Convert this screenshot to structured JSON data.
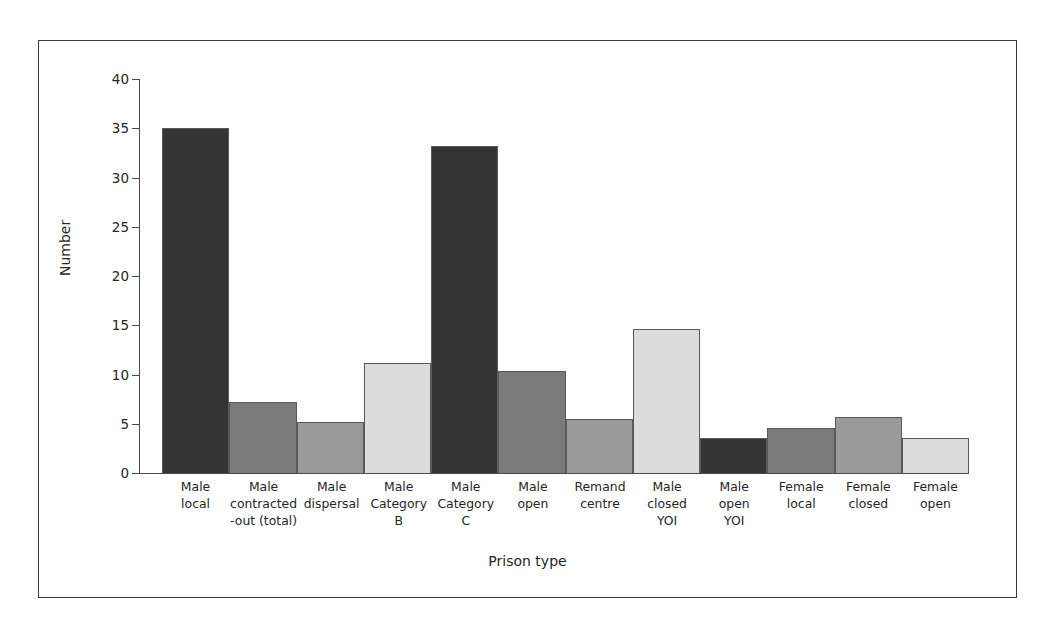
{
  "chart_data": {
    "type": "bar",
    "title": "",
    "xlabel": "Prison type",
    "ylabel": "Number",
    "ylim": [
      0,
      40
    ],
    "yticks": [
      0,
      5,
      10,
      15,
      20,
      25,
      30,
      35,
      40
    ],
    "grid": false,
    "legend": "none",
    "categories": [
      "Male local",
      "Male contracted -out (total)",
      "Male dispersal",
      "Male Category B",
      "Male Category C",
      "Male open",
      "Remand centre",
      "Male closed YOI",
      "Male open YOI",
      "Female local",
      "Female closed",
      "Female open"
    ],
    "category_lines": [
      [
        "Male",
        "local"
      ],
      [
        "Male",
        "contracted",
        "-out (total)"
      ],
      [
        "Male",
        "dispersal"
      ],
      [
        "Male",
        "Category",
        "B"
      ],
      [
        "Male",
        "Category",
        "C"
      ],
      [
        "Male",
        "open"
      ],
      [
        "Remand",
        "centre"
      ],
      [
        "Male",
        "closed",
        "YOI"
      ],
      [
        "Male",
        "open",
        "YOI"
      ],
      [
        "Female",
        "local"
      ],
      [
        "Female",
        "closed"
      ],
      [
        "Female",
        "open"
      ]
    ],
    "values": [
      35,
      7.2,
      5.2,
      11.2,
      33.2,
      10.4,
      5.5,
      14.6,
      3.6,
      4.6,
      5.7,
      3.6
    ],
    "bar_colors": [
      "#353535",
      "#7a7a7a",
      "#9a9a9a",
      "#dcdcdc",
      "#353535",
      "#7a7a7a",
      "#9a9a9a",
      "#dcdcdc",
      "#353535",
      "#7a7a7a",
      "#9a9a9a",
      "#dcdcdc"
    ],
    "bar_edge_color": "#5a5a5a",
    "axis_color": "#4a4a4a",
    "frame_color": "#3a3a3a",
    "background": "#ffffff"
  }
}
